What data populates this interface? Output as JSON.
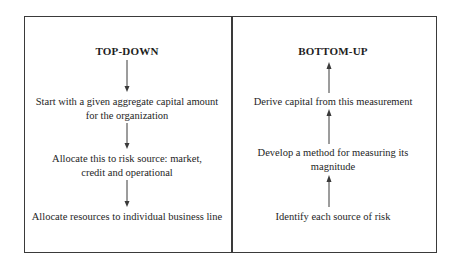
{
  "diagram": {
    "left_panel": {
      "title": "TOP-DOWN",
      "direction": "down",
      "steps": [
        {
          "line1": "Start with a given aggregate capital amount",
          "line2": "for the organization"
        },
        {
          "line1": "Allocate this to risk source: market,",
          "line2": "credit and operational"
        },
        {
          "line1": "Allocate resources to individual business line"
        }
      ]
    },
    "right_panel": {
      "title": "BOTTOM-UP",
      "direction": "up",
      "steps": [
        {
          "line1": "Derive capital from this measurement"
        },
        {
          "line1": "Develop a method for measuring its",
          "line2": "magnitude"
        },
        {
          "line1": "Identify each source of risk"
        }
      ]
    },
    "colors": {
      "line": "#3a3a3a",
      "text": "#1e1e1e",
      "background": "#ffffff"
    }
  }
}
